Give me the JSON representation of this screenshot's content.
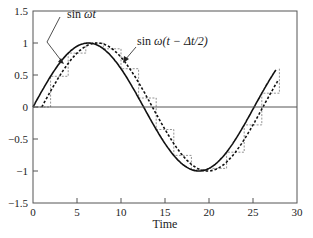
{
  "chart_data": {
    "type": "line",
    "title": "",
    "xlabel": "Time",
    "ylabel": "",
    "xlim": [
      0,
      30
    ],
    "ylim": [
      -1.5,
      1.5
    ],
    "x_ticks": [
      0,
      5,
      10,
      15,
      20,
      25,
      30
    ],
    "x_tick_labels": [
      "0",
      "5",
      "10",
      "15",
      "20",
      "25",
      "30"
    ],
    "y_ticks": [
      1.5,
      1,
      0.5,
      0,
      -0.5,
      -1,
      -1.5
    ],
    "y_tick_labels": [
      "1.5",
      "1",
      "0.5",
      "0",
      "−0.5",
      "−1",
      "−1.5"
    ],
    "grid": false,
    "zero_line": true,
    "omega": 0.25,
    "sample_interval": 2,
    "t_end": 27.7,
    "series": [
      {
        "name": "sin ωt",
        "style": "solid",
        "color": "#111111",
        "x": [
          0,
          2,
          4,
          6,
          8,
          10,
          12,
          14,
          16,
          18,
          20,
          22,
          24,
          26,
          27.7
        ],
        "values": [
          0.0,
          0.48,
          0.84,
          1.0,
          0.91,
          0.6,
          0.14,
          -0.35,
          -0.76,
          -0.98,
          -0.96,
          -0.71,
          -0.28,
          0.21,
          0.6
        ]
      },
      {
        "name": "sin ω(t − Δt/2)",
        "style": "dashed",
        "color": "#111111",
        "x": [
          0,
          2,
          4,
          6,
          8,
          10,
          12,
          14,
          16,
          18,
          20,
          22,
          24,
          26,
          27.7
        ],
        "values": [
          -0.25,
          0.25,
          0.68,
          0.95,
          0.98,
          0.78,
          0.38,
          -0.11,
          -0.57,
          -0.91,
          -1.0,
          -0.85,
          -0.5,
          -0.04,
          0.37
        ]
      },
      {
        "name": "zero-order hold (sampled sin ωt)",
        "style": "dashed-thin",
        "color": "#666666",
        "x": [
          0,
          2,
          4,
          6,
          8,
          10,
          12,
          14,
          16,
          18,
          20,
          22,
          24,
          26
        ],
        "values": [
          0.0,
          0.48,
          0.84,
          1.0,
          0.91,
          0.6,
          0.14,
          -0.35,
          -0.76,
          -0.98,
          -0.96,
          -0.71,
          -0.28,
          0.21
        ]
      }
    ],
    "annotations": [
      {
        "text_prefix": "sin ",
        "text_italic": "ωt",
        "target": "sin ωt"
      },
      {
        "text_prefix": "sin ",
        "text_italic": "ω(t − Δt/2)",
        "target": "sin ω(t − Δt/2)"
      }
    ]
  }
}
